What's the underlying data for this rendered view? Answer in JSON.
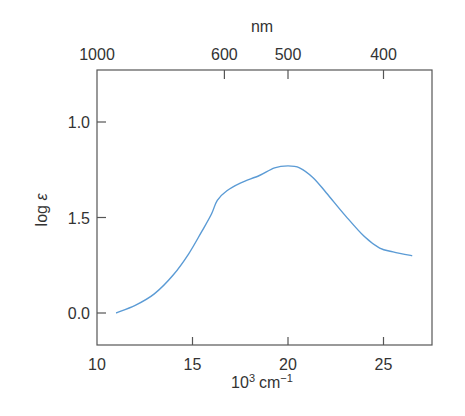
{
  "chart_data": {
    "type": "line",
    "title": "",
    "xlabel": "10³ cm⁻¹",
    "xlabel_base": "10",
    "xlabel_sup": "3",
    "xlabel_unit": "cm",
    "xlabel_unit_sup": "−1",
    "x2label": "nm",
    "ylabel": "log ε",
    "ylabel_log": "log",
    "ylabel_sym": "ε",
    "xlim": [
      10,
      27.5
    ],
    "ylim": [
      -0.17,
      1.45
    ],
    "x_ticks": [
      {
        "value": 10,
        "label": "10"
      },
      {
        "value": 15,
        "label": "15"
      },
      {
        "value": 20,
        "label": "20"
      },
      {
        "value": 25,
        "label": "25"
      }
    ],
    "x2_ticks": [
      {
        "value": 10,
        "label": "1000"
      },
      {
        "value": 16.67,
        "label": "600"
      },
      {
        "value": 20,
        "label": "500"
      },
      {
        "value": 25,
        "label": "400"
      }
    ],
    "y_ticks": [
      {
        "value": 1.0,
        "label": "1.0"
      },
      {
        "value": 0.5,
        "label": "1.5"
      },
      {
        "value": 0.0,
        "label": "0.0"
      }
    ],
    "grid": false,
    "series": [
      {
        "name": "absorption",
        "color": "#5b9bd5",
        "x": [
          11.0,
          12.0,
          13.0,
          14.0,
          14.8,
          15.5,
          16.0,
          16.3,
          16.8,
          17.5,
          18.5,
          19.3,
          20.0,
          20.6,
          21.3,
          22.0,
          23.0,
          24.0,
          24.8,
          25.5,
          26.5
        ],
        "y": [
          0.0,
          0.04,
          0.1,
          0.2,
          0.31,
          0.43,
          0.52,
          0.59,
          0.64,
          0.68,
          0.72,
          0.76,
          0.77,
          0.76,
          0.71,
          0.63,
          0.51,
          0.4,
          0.34,
          0.32,
          0.3
        ]
      }
    ]
  }
}
